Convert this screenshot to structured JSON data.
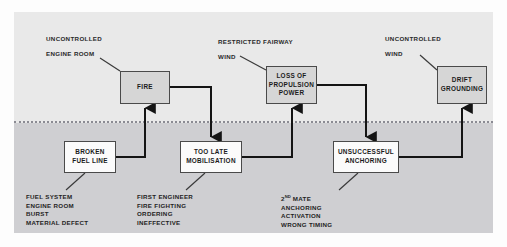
{
  "diagram": {
    "colors": {
      "panel_upper": "#e9e9e9",
      "panel_lower": "#cfcfd2",
      "box_top_fill": "#d6d6d6",
      "box_bottom_fill": "#fbfbfb",
      "box_border": "#4a4a4a",
      "connector": "#141414",
      "divider": "#8b8b93",
      "text": "#1b1b1b"
    },
    "boxes": {
      "fire": "FIRE",
      "loss_of_propulsion": "LOSS OF\nPROPULSION\nPOWER",
      "drift_grounding": "DRIFT\nGROUNDING",
      "broken_fuel_line": "BROKEN\nFUEL LINE",
      "too_late_mobilisation": "TOO LATE\nMOBILISATION",
      "unsuccessful_anchoring": "UNSUCCESSFUL\nANCHORING"
    },
    "annotations": [
      {
        "key": "fire",
        "line1": "UNCONTROLLED",
        "line2": "ENGINE ROOM"
      },
      {
        "key": "loss",
        "line1": "RESTRICTED FAIRWAY",
        "line2": "WIND"
      },
      {
        "key": "drift",
        "line1": "UNCONTROLLED",
        "line2": "WIND"
      }
    ],
    "cause_lists": [
      {
        "key": "broken-fuel-line",
        "items": [
          "FUEL SYSTEM",
          "ENGINE ROOM",
          "BURST",
          "MATERIAL DEFECT"
        ]
      },
      {
        "key": "too-late-mobilisation",
        "items": [
          "FIRST ENGINEER",
          "FIRE FIGHTING",
          "ORDERING",
          "INEFFECTIVE"
        ]
      },
      {
        "key": "unsuccessful-anchoring",
        "items": [
          "2ND MATE",
          "ANCHORING",
          "ACTIVATION",
          "WRONG TIMING"
        ],
        "first_item_superscript": {
          "base": "2",
          "sup": "ND",
          "rest": " MATE"
        }
      }
    ]
  }
}
